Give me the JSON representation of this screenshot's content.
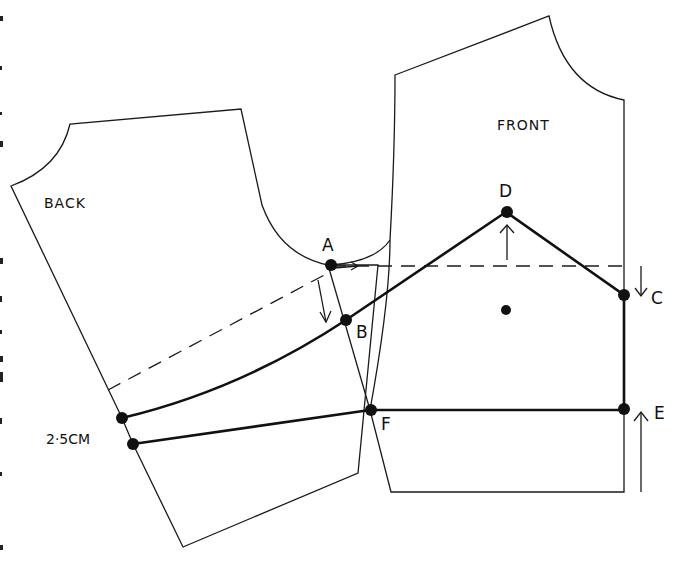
{
  "diagram": {
    "pieces": {
      "back": {
        "label": "BACK"
      },
      "front": {
        "label": "FRONT"
      }
    },
    "points": {
      "A": "A",
      "B": "B",
      "C": "C",
      "D": "D",
      "E": "E",
      "F": "F"
    },
    "measurement": {
      "label": "2·5CM"
    },
    "colors": {
      "line": "#1a1a1a",
      "background": "#ffffff"
    }
  }
}
